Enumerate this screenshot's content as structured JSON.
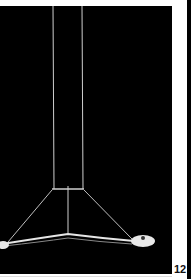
{
  "page": {
    "page_number": "12",
    "photo": {
      "subject": "pendant-lamp",
      "background_color": "#000000",
      "line_color": "#d8d8d8"
    }
  }
}
